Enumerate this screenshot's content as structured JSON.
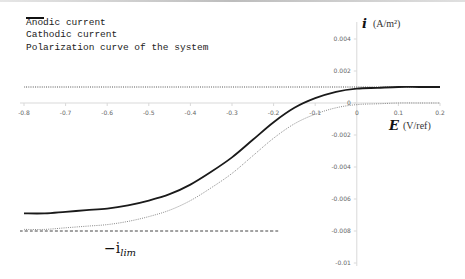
{
  "chart_data": {
    "type": "line",
    "title": "",
    "xlabel": "E (V/ref)",
    "xlabel_symbol": "E",
    "xlabel_unit": "(V/ref)",
    "ylabel": "i (A/m²)",
    "ylabel_symbol": "i",
    "ylabel_unit": "(A/m²)",
    "xlim": [
      -0.8,
      0.2
    ],
    "ylim": [
      -0.01,
      0.005
    ],
    "grid": false,
    "legend_position": "top-left",
    "x_ticks": [
      -0.8,
      -0.7,
      -0.6,
      -0.5,
      -0.4,
      -0.3,
      -0.2,
      -0.1,
      0,
      0.1,
      0.2
    ],
    "x_tick_labels": [
      "-0.8",
      "-0.7",
      "-0.6",
      "-0.5",
      "-0.4",
      "-0.3",
      "-0.2",
      "-0.1",
      "0",
      "0.1",
      "0.2"
    ],
    "y_ticks": [
      0.004,
      0.002,
      0,
      -0.002,
      -0.004,
      -0.006,
      -0.008,
      -0.01
    ],
    "y_tick_labels": [
      "0.004",
      "0.002",
      "0",
      "-0.002",
      "-0.004",
      "-0.006",
      "-0.008",
      "-0.01"
    ],
    "x": [
      -0.8,
      -0.75,
      -0.7,
      -0.65,
      -0.6,
      -0.55,
      -0.5,
      -0.45,
      -0.4,
      -0.35,
      -0.3,
      -0.25,
      -0.2,
      -0.15,
      -0.1,
      -0.05,
      0,
      0.05,
      0.1,
      0.15,
      0.2
    ],
    "series": [
      {
        "name": "Anodic current",
        "style": "dotted",
        "color": "#555555",
        "values": [
          0.001,
          0.001,
          0.001,
          0.001,
          0.001,
          0.001,
          0.001,
          0.001,
          0.001,
          0.001,
          0.001,
          0.001,
          0.001,
          0.001,
          0.001,
          0.001,
          0.001,
          0.001,
          0.001,
          0.001,
          0.001
        ]
      },
      {
        "name": "Cathodic current",
        "style": "dotted",
        "color": "#888888",
        "values": [
          -0.0079,
          -0.0079,
          -0.0078,
          -0.0077,
          -0.0076,
          -0.0074,
          -0.0071,
          -0.0067,
          -0.0061,
          -0.0053,
          -0.0044,
          -0.0033,
          -0.0022,
          -0.0013,
          -0.0007,
          -0.0003,
          -0.0001,
          -5e-05,
          0,
          0,
          0
        ]
      },
      {
        "name": "Polarization curve of the system",
        "style": "solid",
        "color": "#1a1a1a",
        "values": [
          -0.0069,
          -0.0069,
          -0.0068,
          -0.0067,
          -0.0066,
          -0.0064,
          -0.0061,
          -0.0057,
          -0.0051,
          -0.0043,
          -0.0034,
          -0.0023,
          -0.0012,
          -0.0003,
          0.0003,
          0.0007,
          0.0009,
          0.00095,
          0.001,
          0.001,
          0.001
        ]
      },
      {
        "name": "-i_lim",
        "style": "dashed",
        "color": "#444444",
        "x_range": [
          -0.8,
          -0.2
        ],
        "values_const": -0.008
      }
    ],
    "annotations": [
      {
        "text": "−i_lim",
        "x": -0.45,
        "y": -0.0085
      }
    ]
  },
  "legend": {
    "items": [
      {
        "label": "Anodic current",
        "style": "dotted"
      },
      {
        "label": "Cathodic current",
        "style": "dotted"
      },
      {
        "label": "Polarization curve of the system",
        "style": "solid"
      }
    ]
  },
  "axes": {
    "y_symbol": "i",
    "y_unit": "(A/m²)",
    "x_symbol": "E",
    "x_unit": "(V/ref)",
    "ilim_main": "−i",
    "ilim_sub": "lim"
  }
}
